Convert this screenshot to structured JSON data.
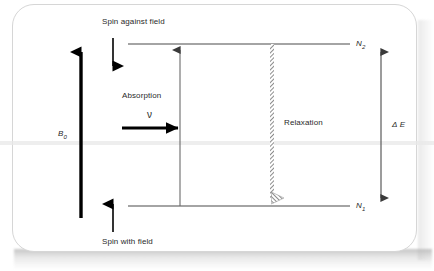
{
  "figure": {
    "title_note": "NMR energy level diagram",
    "labels": {
      "spin_against_field": "Spin against field",
      "spin_with_field": "Spin with field",
      "absorption": "Absorption",
      "nu_symbol": "ν",
      "relaxation": "Relaxation",
      "field_symbol": "B",
      "field_subscript": "0",
      "upper_level": "N",
      "upper_level_subscript": "2",
      "lower_level": "N",
      "lower_level_subscript": "1",
      "delta_symbol": "Δ",
      "energy_symbol": "E"
    },
    "colors": {
      "line": "#4a4a4a",
      "bold_arrow": "#000000",
      "hatched_arrow": "#8a8a8a",
      "text": "#2a2a2a",
      "card_border": "#d6d6d6",
      "background": "#ffffff"
    },
    "geometry": {
      "upper_level_y": 44,
      "lower_level_y": 206,
      "level_line_x_start": 128,
      "level_line_x_end": 350,
      "absorption_arrow_x": 180,
      "relaxation_arrow_x": 272,
      "delta_e_arrow_x": 381,
      "b0_arrow_x": 81
    }
  }
}
